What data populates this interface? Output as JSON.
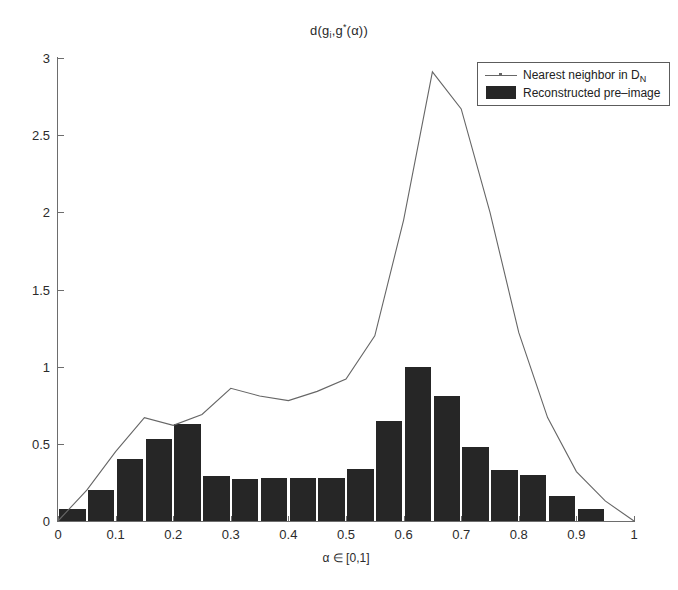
{
  "chart_data": {
    "type": "bar",
    "title_parts": {
      "lead": "d(g",
      "sub1": "i",
      "mid": ",g",
      "star": "*",
      "tail": "(α))"
    },
    "xlabel": "α ∈ [0,1]",
    "ylabel": "",
    "xlim": [
      0,
      1
    ],
    "ylim": [
      0,
      3
    ],
    "grid": false,
    "legend_position": "top-right",
    "xticks": [
      "0",
      "0.1",
      "0.2",
      "0.3",
      "0.4",
      "0.5",
      "0.6",
      "0.7",
      "0.8",
      "0.9",
      "1"
    ],
    "xtick_values": [
      0,
      0.1,
      0.2,
      0.3,
      0.4,
      0.5,
      0.6,
      0.7,
      0.8,
      0.9,
      1
    ],
    "yticks": [
      "0",
      "0.5",
      "1",
      "1.5",
      "2",
      "2.5",
      "3"
    ],
    "ytick_values": [
      0,
      0.5,
      1,
      1.5,
      2,
      2.5,
      3
    ],
    "bar_width": 0.05,
    "categories": [
      0.025,
      0.075,
      0.125,
      0.175,
      0.225,
      0.275,
      0.325,
      0.375,
      0.425,
      0.475,
      0.525,
      0.575,
      0.625,
      0.675,
      0.725,
      0.775,
      0.825,
      0.875,
      0.925,
      0.975
    ],
    "series": [
      {
        "name": "Reconstructed pre-image",
        "type": "bar",
        "color": "#262626",
        "values": [
          0.08,
          0.2,
          0.4,
          0.53,
          0.63,
          0.29,
          0.27,
          0.28,
          0.28,
          0.28,
          0.34,
          0.65,
          1.0,
          0.81,
          0.48,
          0.33,
          0.3,
          0.16,
          0.08,
          0.0
        ]
      },
      {
        "name": "Nearest neighbor in D_N",
        "type": "line",
        "color": "#666666",
        "x": [
          0.0,
          0.05,
          0.1,
          0.15,
          0.2,
          0.25,
          0.3,
          0.35,
          0.4,
          0.45,
          0.5,
          0.55,
          0.6,
          0.65,
          0.7,
          0.75,
          0.8,
          0.85,
          0.9,
          0.95,
          1.0
        ],
        "y": [
          0.0,
          0.2,
          0.45,
          0.67,
          0.62,
          0.69,
          0.86,
          0.81,
          0.78,
          0.84,
          0.92,
          1.2,
          1.95,
          2.91,
          2.67,
          2.0,
          1.22,
          0.67,
          0.32,
          0.13,
          0.0
        ]
      }
    ]
  },
  "legend": {
    "items": [
      {
        "label_lead": "Nearest neighbor in D",
        "label_sub": "N",
        "marker": "line"
      },
      {
        "label_lead": "Reconstructed pre–image",
        "label_sub": "",
        "marker": "patch"
      }
    ]
  }
}
